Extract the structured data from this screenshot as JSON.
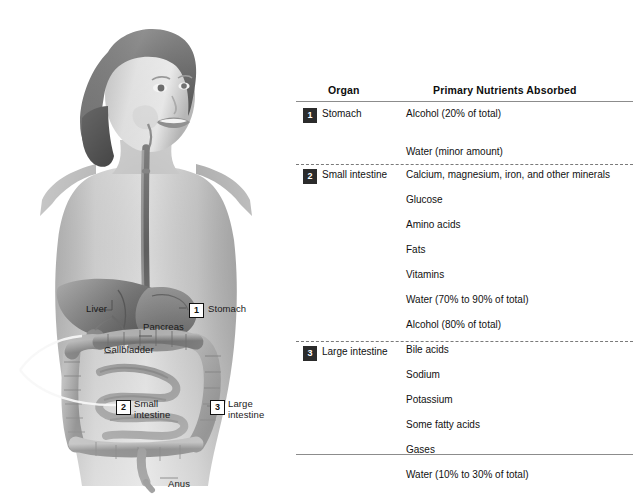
{
  "figure": {
    "alt_name": "digestive-system-illustration",
    "labels": [
      {
        "name": "liver",
        "text": "Liver"
      },
      {
        "name": "pancreas",
        "text": "Pancreas"
      },
      {
        "name": "gallbladder",
        "text": "Gallbladder"
      },
      {
        "name": "stomach",
        "text": "Stomach"
      },
      {
        "name": "small-intestine",
        "text": "Small\nintestine"
      },
      {
        "name": "large-intestine",
        "text": "Large\nintestine"
      },
      {
        "name": "anus",
        "text": "Anus"
      }
    ],
    "badges": [
      {
        "name": "stomach",
        "number": "1"
      },
      {
        "name": "small-intestine",
        "number": "2"
      },
      {
        "name": "large-intestine",
        "number": "3"
      }
    ]
  },
  "table": {
    "headers": {
      "organ": "Organ",
      "nutrients": "Primary Nutrients Absorbed"
    },
    "rows": [
      {
        "badge": "1",
        "organ": "Stomach",
        "nutrients": [
          "Alcohol (20% of total)",
          "",
          "Water (minor amount)"
        ]
      },
      {
        "badge": "2",
        "organ": "Small intestine",
        "nutrients": [
          "Calcium, magnesium, iron, and other minerals",
          "Glucose",
          "Amino acids",
          "Fats",
          "Vitamins",
          "Water (70% to 90% of total)",
          "Alcohol (80% of total)",
          "Bile acids"
        ]
      },
      {
        "badge": "3",
        "organ": "Large intestine",
        "nutrients": [
          "Sodium",
          "Potassium",
          "Some fatty acids",
          "Gases",
          "Water (10% to 30% of total)"
        ]
      }
    ]
  },
  "colors": {
    "badge_fill": "#2b2b2b",
    "badge_text": "#ffffff",
    "rule": "#8c8c8c",
    "text": "#111111",
    "background": "#ffffff"
  }
}
